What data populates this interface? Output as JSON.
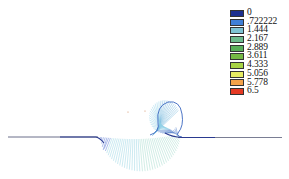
{
  "chart_data": {
    "type": "vector-field",
    "title": "",
    "xlabel": "",
    "ylabel": "",
    "legend": {
      "position": "top-right",
      "entries": [
        {
          "label": "0",
          "value": 0,
          "color": "#1c2f8f"
        },
        {
          "label": ".722222",
          "value": 0.722222,
          "color": "#3f7fd6"
        },
        {
          "label": "1.444",
          "value": 1.444,
          "color": "#7ec3d3"
        },
        {
          "label": "2.167",
          "value": 2.167,
          "color": "#6dbb8d"
        },
        {
          "label": "2.889",
          "value": 2.889,
          "color": "#58ae59"
        },
        {
          "label": "3.611",
          "value": 3.611,
          "color": "#74b844"
        },
        {
          "label": "4.333",
          "value": 4.333,
          "color": "#a8d444"
        },
        {
          "label": "5.056",
          "value": 5.056,
          "color": "#e6ec62"
        },
        {
          "label": "5.778",
          "value": 5.778,
          "color": "#f3a24a"
        },
        {
          "label": "6.5",
          "value": 6.5,
          "color": "#e53a24"
        }
      ]
    },
    "range": [
      0,
      6.5
    ],
    "grid": false
  }
}
